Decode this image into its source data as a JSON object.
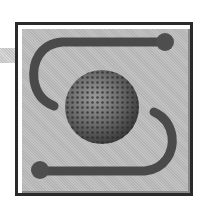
{
  "icon": {
    "name": "globe-swap-icon",
    "description": "Square framed icon with a textured sphere in the center and two S-shaped arrows curving around it",
    "colors": {
      "frame_border": "#2a2a2a",
      "frame_fill": "#bcbcbc",
      "arrow": "#4a4a4a",
      "sphere_dark": "#3a3a3a",
      "sphere_light": "#9a9a9a",
      "strip": "#cccccc"
    }
  }
}
